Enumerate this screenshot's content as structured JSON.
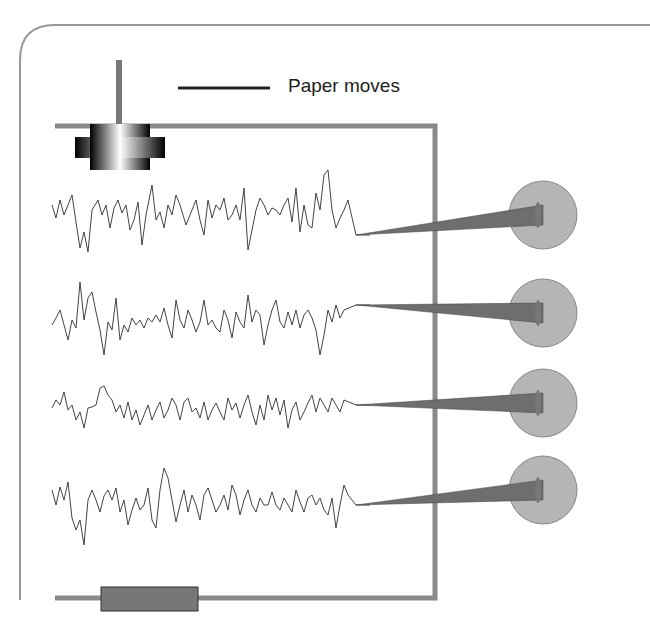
{
  "diagram": {
    "legend": {
      "label": "Paper moves"
    },
    "channels": [
      {
        "id": 1,
        "pen_y": 217
      },
      {
        "id": 2,
        "pen_y": 313
      },
      {
        "id": 3,
        "pen_y": 403
      },
      {
        "id": 4,
        "pen_y": 490
      }
    ],
    "colors": {
      "frame": "#8a8a8a",
      "pen": "#6e6e6e",
      "electrode": "#b5b5b5",
      "trace": "#444444",
      "motor": "#777777"
    }
  }
}
